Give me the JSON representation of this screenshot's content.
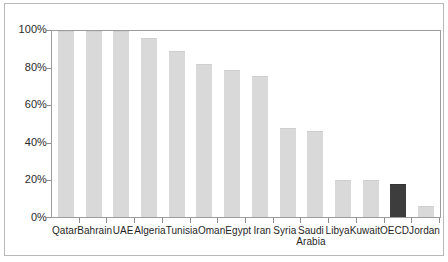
{
  "chart_data": {
    "type": "bar",
    "title": "",
    "subtitle": "",
    "xlabel": "",
    "ylabel": "",
    "ylim": [
      0,
      100
    ],
    "grid": false,
    "legend": "none",
    "y_ticks": [
      "0%",
      "20%",
      "40%",
      "60%",
      "80%",
      "100%"
    ],
    "y_tick_values": [
      0,
      20,
      40,
      60,
      80,
      100
    ],
    "categories": [
      "Qatar",
      "Bahrain",
      "UAE",
      "Algeria",
      "Tunisia",
      "Oman",
      "Egypt",
      "Iran",
      "Syria",
      "Saudi Arabia",
      "Libya",
      "Kuwait",
      "OECD",
      "Jordan"
    ],
    "values": [
      100,
      100,
      100,
      96,
      89,
      82,
      79,
      76,
      48,
      46,
      20,
      20,
      18,
      6
    ],
    "highlight_category": "OECD",
    "colors": {
      "bar": "#d9d9d9",
      "bar_highlight": "#3d3d3d",
      "axis": "#9c9c9c",
      "tick": "#8d8d8d",
      "text": "#1f1f1f",
      "frame": "#b9b9b9",
      "background": "#ffffff"
    }
  }
}
